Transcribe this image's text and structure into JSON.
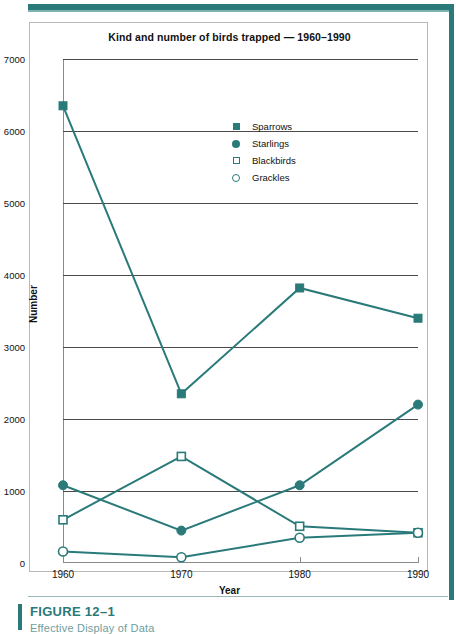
{
  "figure": {
    "caption": "FIGURE 12–1",
    "subcaption": "Effective Display of Data"
  },
  "colors": {
    "accent": "#2a7a7a",
    "gridline": "#4a4a4a",
    "axis": "#8a8a8a",
    "frame": "#b8b8b8"
  },
  "chart_data": {
    "type": "line",
    "title": "Kind and number of birds trapped — 1960–1990",
    "xlabel": "Year",
    "ylabel": "Number",
    "categories": [
      "1960",
      "1970",
      "1980",
      "1990"
    ],
    "x": [
      1960,
      1970,
      1980,
      1990
    ],
    "xlim": [
      1960,
      1990
    ],
    "ylim": [
      0,
      7000
    ],
    "yticks": [
      0,
      1000,
      2000,
      3000,
      4000,
      5000,
      6000,
      7000
    ],
    "ytick_labels": [
      "0",
      "1000",
      "2000",
      "3000",
      "4000",
      "5000",
      "6000",
      "7000"
    ],
    "grid": true,
    "legend_position": "upper-center-right",
    "series": [
      {
        "name": "Sparrows",
        "marker": "filled-square",
        "values": [
          6350,
          2350,
          3820,
          3400
        ]
      },
      {
        "name": "Starlings",
        "marker": "filled-circle",
        "values": [
          1080,
          450,
          1080,
          2200
        ]
      },
      {
        "name": "Blackbirds",
        "marker": "open-square",
        "values": [
          600,
          1480,
          510,
          420
        ]
      },
      {
        "name": "Grackles",
        "marker": "open-circle",
        "values": [
          160,
          80,
          350,
          420
        ]
      }
    ]
  }
}
